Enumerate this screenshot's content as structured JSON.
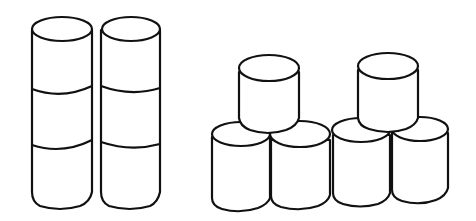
{
  "figure": {
    "stroke_color": "#111111",
    "background": "#ffffff",
    "groups": [
      {
        "name": "towers",
        "arrangement": "two vertical stacks side by side",
        "stacks": 2,
        "cylinders_per_stack": 3,
        "total_cylinders": 6
      },
      {
        "name": "pyramids",
        "arrangement": "two pyramids, each with 2 cylinders on the bottom and 1 on top",
        "bottom_row_cylinders": 4,
        "top_row_cylinders": 2,
        "total_cylinders": 6
      }
    ]
  }
}
